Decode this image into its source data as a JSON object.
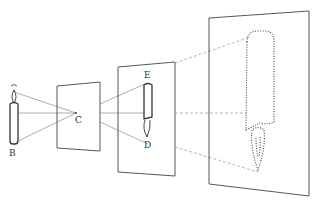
{
  "diagram": {
    "labels": {
      "candle": "B",
      "pinhole": "C",
      "image_top": "E",
      "image_bottom": "D"
    },
    "colors": {
      "line": "#555555",
      "frame": "#444444",
      "background": "#ffffff"
    },
    "elements": [
      {
        "name": "candle",
        "label": "B"
      },
      {
        "name": "pinhole-screen",
        "label": "C"
      },
      {
        "name": "image-screen",
        "labels": [
          "E",
          "D"
        ]
      },
      {
        "name": "large-screen",
        "style": "dotted image"
      }
    ]
  }
}
